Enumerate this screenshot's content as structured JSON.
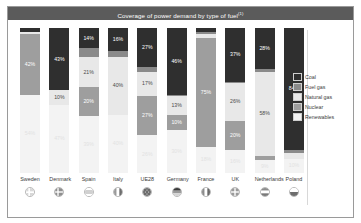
{
  "header": {
    "title": "Coverage of power demand by type of fuel",
    "title_superscript": "(1)"
  },
  "colors": {
    "header_bg": "#5b5b5b",
    "coal": "#2f2f2f",
    "fuel_gas": "#8a8a8a",
    "natural_gas": "#e8e8e8",
    "nuclear": "#9e9e9e",
    "renewables": "#f3f3f3",
    "panel_border": "#9a9a9a",
    "text": "#3b3b3b"
  },
  "legend": {
    "position": "right",
    "items": [
      {
        "label": "Coal",
        "key": "coal",
        "color": "#2f2f2f"
      },
      {
        "label": "Fuel gas",
        "key": "fuel_gas",
        "color": "#8a8a8a"
      },
      {
        "label": "Natural gas",
        "key": "natural_gas",
        "color": "#e8e8e8"
      },
      {
        "label": "Nuclear",
        "key": "nuclear",
        "color": "#9e9e9e"
      },
      {
        "label": "Renewables",
        "key": "renewables",
        "color": "#f3f3f3"
      }
    ]
  },
  "chart_data": {
    "type": "bar",
    "subtype": "stacked-100-percent",
    "title": "Coverage of power demand by type of fuel",
    "xlabel": "",
    "ylabel": "",
    "ylim": [
      0,
      100
    ],
    "grid": false,
    "legend_position": "right",
    "categories": [
      "Sweden",
      "Denmark",
      "Spain",
      "Italy",
      "UE28",
      "Germany",
      "France",
      "UK",
      "Netherlands",
      "Poland"
    ],
    "series": [
      {
        "name": "Coal",
        "values": [
          3,
          43,
          14,
          16,
          27,
          46,
          3,
          37,
          28,
          84
        ]
      },
      {
        "name": "Fuel gas",
        "values": [
          0,
          0,
          6,
          4,
          3,
          1,
          1,
          1,
          2,
          2
        ]
      },
      {
        "name": "Natural gas",
        "values": [
          1,
          10,
          21,
          40,
          17,
          13,
          3,
          26,
          58,
          4
        ]
      },
      {
        "name": "Nuclear",
        "values": [
          42,
          0,
          20,
          0,
          27,
          10,
          75,
          20,
          3,
          0
        ]
      },
      {
        "name": "Renewables",
        "values": [
          54,
          47,
          39,
          40,
          26,
          30,
          18,
          16,
          9,
          10
        ]
      }
    ],
    "data_labels": {
      "Sweden": {
        "Nuclear": "42%",
        "Renewables": "54%"
      },
      "Denmark": {
        "Coal": "43%",
        "Natural gas": "10%",
        "Renewables": "47%"
      },
      "Spain": {
        "Coal": "14%",
        "Natural gas": "21%",
        "Nuclear": "20%",
        "Renewables": "39%"
      },
      "Italy": {
        "Coal": "16%",
        "Natural gas": "40%",
        "Renewables": "40%"
      },
      "UE28": {
        "Coal": "27%",
        "Natural gas": "17%",
        "Nuclear": "27%",
        "Renewables": "26%"
      },
      "Germany": {
        "Coal": "46%",
        "Natural gas": "13%",
        "Nuclear": "10%",
        "Renewables": "30%"
      },
      "France": {
        "Nuclear": "75%",
        "Renewables": "18%"
      },
      "UK": {
        "Coal": "37%",
        "Natural gas": "26%",
        "Nuclear": "20%",
        "Renewables": "16%"
      },
      "Netherlands": {
        "Coal": "28%",
        "Natural gas": "58%",
        "Renewables": "9%"
      },
      "Poland": {
        "Coal": "84%",
        "Renewables": "10%"
      }
    }
  },
  "axis": {
    "countries": [
      {
        "label": "Sweden",
        "flag": "flag-icon-sweden"
      },
      {
        "label": "Denmark",
        "flag": "flag-icon-denmark"
      },
      {
        "label": "Spain",
        "flag": "flag-icon-spain"
      },
      {
        "label": "Italy",
        "flag": "flag-icon-italy"
      },
      {
        "label": "UE28",
        "flag": "flag-icon-eu"
      },
      {
        "label": "Germany",
        "flag": "flag-icon-germany"
      },
      {
        "label": "France",
        "flag": "flag-icon-france"
      },
      {
        "label": "UK",
        "flag": "flag-icon-uk"
      },
      {
        "label": "Netherlands",
        "flag": "flag-icon-netherlands"
      },
      {
        "label": "Poland",
        "flag": "flag-icon-poland"
      }
    ]
  }
}
